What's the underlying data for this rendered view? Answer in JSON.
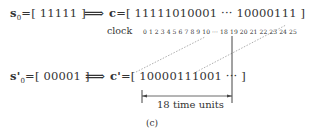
{
  "figure": {
    "row1": {
      "seed_label": "s",
      "seed_subscript": "0",
      "seed_value": "=[ 11111 ]",
      "implies": "⟹",
      "output_label": "c",
      "output_value": "=[ 11111010001 ··· 10000111 ]"
    },
    "clock": {
      "label": "clock",
      "ticks": "0 1 2 3 4 5 6 7 8 9 10 ··· 18 19 20 21 22 23 24 25"
    },
    "row2": {
      "seed_label": "s'",
      "seed_subscript": "0",
      "seed_value": "=[ 00001 ]",
      "implies": "⟹",
      "output_label": "c'",
      "output_value": "=[ 10000111001 ··· ]"
    },
    "span": {
      "label": "18 time units"
    },
    "caption": "(c)",
    "colors": {
      "text": "#333333",
      "line": "#444444",
      "dashed": "#999999"
    }
  }
}
